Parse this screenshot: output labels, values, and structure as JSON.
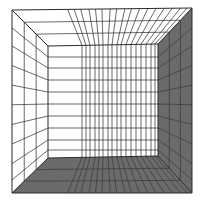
{
  "figure": {
    "kind": "perspective-room-grid",
    "width": 200,
    "height": 210,
    "colors": {
      "background": "#ffffff",
      "light_surface": "#ffffff",
      "dark_surface": "#6b6b6b",
      "line": "#2a2a2a",
      "line_on_dark": "#3a3a3a"
    },
    "outer": {
      "tl": [
        12,
        10
      ],
      "tr": [
        192,
        8
      ],
      "br": [
        192,
        193
      ],
      "bl": [
        12,
        193
      ]
    },
    "inner": {
      "tl": [
        48,
        46
      ],
      "tr": [
        158,
        44
      ],
      "br": [
        158,
        156
      ],
      "bl": [
        48,
        158
      ]
    },
    "back_wall_vertical_x": [
      82,
      86,
      90,
      95,
      99,
      103,
      108,
      112,
      117,
      121,
      126,
      131,
      136,
      141,
      146,
      151,
      155
    ],
    "back_wall_horizontal_y": [
      57,
      68,
      80,
      92,
      104,
      116,
      128,
      140,
      150
    ],
    "side_depth_fractions": [
      0.33,
      0.66
    ],
    "surfaces": {
      "ceiling": "light",
      "left_wall": "light",
      "back_wall": "light",
      "right_wall": "dark",
      "floor": "dark"
    }
  }
}
